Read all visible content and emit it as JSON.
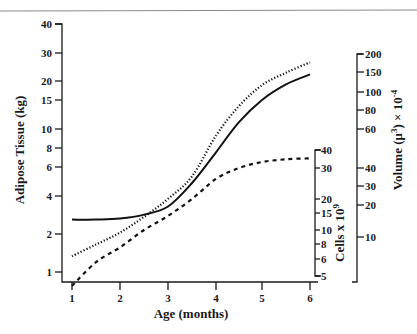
{
  "chart_data": {
    "type": "line",
    "title": "",
    "xlabel": "Age (months)",
    "x": [
      1,
      2,
      3,
      4,
      5,
      6
    ],
    "xlim": [
      1,
      6
    ],
    "x_ticks": [
      "1",
      "2",
      "3",
      "4",
      "5",
      "6"
    ],
    "grid": false,
    "legend": null,
    "axes": {
      "left": {
        "label": "Adipose Tissue (kg)",
        "scale": "log",
        "ticks": [
          "1",
          "2",
          "4",
          "6",
          "8",
          "10",
          "15",
          "20",
          "30",
          "40"
        ],
        "ylim": [
          1,
          40
        ]
      },
      "right_inner": {
        "label": "Cells x 10",
        "label_superscript": "9",
        "scale": "log",
        "ticks": [
          "5",
          "6",
          "8",
          "10",
          "15",
          "20",
          "30",
          "40"
        ],
        "ylim": [
          5,
          40
        ]
      },
      "right_outer": {
        "label": "Volume (μ",
        "label_superscript": "3",
        "label_suffix": ") × 10",
        "label_superscript2": "-4",
        "scale": "log",
        "ticks": [
          "10",
          "20",
          "30",
          "40",
          "60",
          "80",
          "100",
          "150",
          "200"
        ],
        "ylim": [
          10,
          200
        ]
      }
    },
    "series": [
      {
        "name": "Adipose Tissue (kg)",
        "axis": "left",
        "style": "solid",
        "x": [
          1,
          1.5,
          2,
          2.5,
          3,
          3.5,
          4,
          4.5,
          5,
          5.5,
          6
        ],
        "values": [
          2.6,
          2.6,
          2.65,
          2.85,
          3.3,
          4.8,
          7.5,
          11,
          15,
          19,
          22
        ]
      },
      {
        "name": "Volume (μ³) × 10⁻⁴",
        "axis": "right_outer",
        "style": "dotted",
        "x": [
          1,
          1.5,
          2,
          2.5,
          3,
          3.5,
          4,
          4.5,
          5,
          5.5,
          6
        ],
        "values": [
          6.6,
          8.5,
          11,
          15.5,
          22.8,
          35,
          56,
          84,
          115,
          148,
          175
        ]
      },
      {
        "name": "Cells x 10⁹",
        "axis": "right_inner",
        "style": "dashed",
        "x": [
          1,
          1.5,
          2,
          2.5,
          3,
          3.5,
          4,
          4.5,
          5,
          5.5,
          6
        ],
        "values": [
          4.5,
          5.8,
          7.5,
          10,
          14,
          20,
          26,
          30,
          33,
          34.5,
          35
        ]
      }
    ]
  }
}
